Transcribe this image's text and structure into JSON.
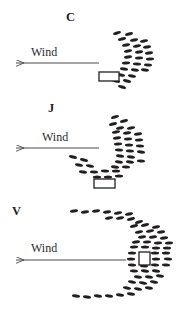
{
  "figure": {
    "title": "",
    "background_color": "#ffffff",
    "ink_color": "#231f20",
    "arrow_color": "#4a4a4a",
    "width": 183,
    "height": 315
  },
  "chart_data": {
    "type": "scatter",
    "title": "",
    "xlabel": "",
    "ylabel": "",
    "grid": false,
    "legend": null,
    "panels": [
      {
        "label": "C",
        "label_position": {
          "x": 66,
          "y": 11
        },
        "wind": {
          "text": "Wind",
          "text_position": {
            "x": 31,
            "y": 46
          },
          "arrow": {
            "x1": 99,
            "y1": 63,
            "x2": 9,
            "y2": 63,
            "direction": "left"
          }
        },
        "vessel": {
          "x": 99,
          "y": 72,
          "width": 20,
          "height": 9,
          "shape": "rectangle"
        },
        "marks": [
          {
            "x": 117,
            "y": 33,
            "angle": -18
          },
          {
            "x": 129,
            "y": 34,
            "angle": -14
          },
          {
            "x": 122,
            "y": 39,
            "angle": -14
          },
          {
            "x": 134,
            "y": 40,
            "angle": -12
          },
          {
            "x": 144,
            "y": 41,
            "angle": -10
          },
          {
            "x": 126,
            "y": 45,
            "angle": -12
          },
          {
            "x": 137,
            "y": 46,
            "angle": -10
          },
          {
            "x": 147,
            "y": 47,
            "angle": -8
          },
          {
            "x": 128,
            "y": 51,
            "angle": -10
          },
          {
            "x": 139,
            "y": 52,
            "angle": -8
          },
          {
            "x": 149,
            "y": 53,
            "angle": -6
          },
          {
            "x": 128,
            "y": 57,
            "angle": -6
          },
          {
            "x": 139,
            "y": 58,
            "angle": -4
          },
          {
            "x": 150,
            "y": 59,
            "angle": -2
          },
          {
            "x": 126,
            "y": 63,
            "angle": -2
          },
          {
            "x": 137,
            "y": 64,
            "angle": 2
          },
          {
            "x": 148,
            "y": 65,
            "angle": 4
          },
          {
            "x": 124,
            "y": 69,
            "angle": 6
          },
          {
            "x": 135,
            "y": 70,
            "angle": 8
          },
          {
            "x": 145,
            "y": 70,
            "angle": 8
          },
          {
            "x": 121,
            "y": 75,
            "angle": 10
          },
          {
            "x": 132,
            "y": 76,
            "angle": 12
          },
          {
            "x": 116,
            "y": 81,
            "angle": 14
          },
          {
            "x": 127,
            "y": 81,
            "angle": 14
          },
          {
            "x": 122,
            "y": 87,
            "angle": 16
          }
        ]
      },
      {
        "label": "J",
        "label_position": {
          "x": 48,
          "y": 102
        },
        "wind": {
          "text": "Wind",
          "text_position": {
            "x": 42,
            "y": 131
          },
          "arrow": {
            "x1": 99,
            "y1": 148,
            "x2": 9,
            "y2": 148,
            "direction": "left"
          }
        },
        "vessel": {
          "x": 94,
          "y": 179,
          "width": 21,
          "height": 9,
          "shape": "rectangle"
        },
        "marks": [
          {
            "x": 115,
            "y": 117,
            "angle": -16
          },
          {
            "x": 124,
            "y": 121,
            "angle": -14
          },
          {
            "x": 113,
            "y": 124,
            "angle": -14
          },
          {
            "x": 120,
            "y": 128,
            "angle": -12
          },
          {
            "x": 131,
            "y": 128,
            "angle": -10
          },
          {
            "x": 116,
            "y": 132,
            "angle": -10
          },
          {
            "x": 127,
            "y": 133,
            "angle": -8
          },
          {
            "x": 138,
            "y": 134,
            "angle": -6
          },
          {
            "x": 117,
            "y": 138,
            "angle": -6
          },
          {
            "x": 128,
            "y": 139,
            "angle": -4
          },
          {
            "x": 139,
            "y": 140,
            "angle": -2
          },
          {
            "x": 118,
            "y": 144,
            "angle": -2
          },
          {
            "x": 129,
            "y": 145,
            "angle": 0
          },
          {
            "x": 140,
            "y": 146,
            "angle": 2
          },
          {
            "x": 119,
            "y": 150,
            "angle": 2
          },
          {
            "x": 130,
            "y": 151,
            "angle": 4
          },
          {
            "x": 141,
            "y": 152,
            "angle": 6
          },
          {
            "x": 120,
            "y": 156,
            "angle": 6
          },
          {
            "x": 131,
            "y": 157,
            "angle": 8
          },
          {
            "x": 73,
            "y": 157,
            "angle": 14
          },
          {
            "x": 84,
            "y": 160,
            "angle": 14
          },
          {
            "x": 119,
            "y": 162,
            "angle": 8
          },
          {
            "x": 130,
            "y": 162,
            "angle": 8
          },
          {
            "x": 141,
            "y": 161,
            "angle": 4
          },
          {
            "x": 79,
            "y": 165,
            "angle": 12
          },
          {
            "x": 90,
            "y": 166,
            "angle": 10
          },
          {
            "x": 115,
            "y": 167,
            "angle": 6
          },
          {
            "x": 126,
            "y": 167,
            "angle": 4
          },
          {
            "x": 83,
            "y": 172,
            "angle": 6
          },
          {
            "x": 94,
            "y": 172,
            "angle": 4
          },
          {
            "x": 105,
            "y": 171,
            "angle": 2
          },
          {
            "x": 116,
            "y": 171,
            "angle": 0
          },
          {
            "x": 97,
            "y": 177,
            "angle": 0
          },
          {
            "x": 108,
            "y": 177,
            "angle": 0
          },
          {
            "x": 119,
            "y": 176,
            "angle": 0
          }
        ]
      },
      {
        "label": "V",
        "label_position": {
          "x": 12,
          "y": 205
        },
        "wind": {
          "text": "Wind",
          "text_position": {
            "x": 31,
            "y": 242
          },
          "arrow": {
            "x1": 126,
            "y1": 260,
            "x2": 9,
            "y2": 260,
            "direction": "left"
          }
        },
        "vessel": {
          "x": 139,
          "y": 252,
          "width": 11,
          "height": 13,
          "shape": "rectangle"
        },
        "marks": [
          {
            "x": 74,
            "y": 211,
            "angle": -6
          },
          {
            "x": 85,
            "y": 212,
            "angle": -6
          },
          {
            "x": 96,
            "y": 211,
            "angle": -8
          },
          {
            "x": 107,
            "y": 212,
            "angle": -8
          },
          {
            "x": 118,
            "y": 213,
            "angle": -10
          },
          {
            "x": 129,
            "y": 214,
            "angle": -12
          },
          {
            "x": 109,
            "y": 218,
            "angle": -10
          },
          {
            "x": 120,
            "y": 218,
            "angle": -12
          },
          {
            "x": 131,
            "y": 219,
            "angle": -14
          },
          {
            "x": 139,
            "y": 222,
            "angle": -16
          },
          {
            "x": 134,
            "y": 226,
            "angle": -14
          },
          {
            "x": 145,
            "y": 225,
            "angle": -14
          },
          {
            "x": 156,
            "y": 227,
            "angle": -12
          },
          {
            "x": 139,
            "y": 232,
            "angle": -10
          },
          {
            "x": 150,
            "y": 231,
            "angle": -10
          },
          {
            "x": 161,
            "y": 232,
            "angle": -8
          },
          {
            "x": 142,
            "y": 237,
            "angle": -8
          },
          {
            "x": 153,
            "y": 237,
            "angle": -6
          },
          {
            "x": 164,
            "y": 238,
            "angle": -6
          },
          {
            "x": 136,
            "y": 242,
            "angle": -6
          },
          {
            "x": 147,
            "y": 242,
            "angle": -4
          },
          {
            "x": 158,
            "y": 243,
            "angle": -4
          },
          {
            "x": 169,
            "y": 243,
            "angle": -2
          },
          {
            "x": 134,
            "y": 247,
            "angle": -2
          },
          {
            "x": 145,
            "y": 247,
            "angle": 0
          },
          {
            "x": 156,
            "y": 248,
            "angle": 0
          },
          {
            "x": 167,
            "y": 248,
            "angle": 0
          },
          {
            "x": 132,
            "y": 253,
            "angle": 0
          },
          {
            "x": 155,
            "y": 253,
            "angle": 0
          },
          {
            "x": 166,
            "y": 253,
            "angle": 0
          },
          {
            "x": 131,
            "y": 259,
            "angle": 0
          },
          {
            "x": 156,
            "y": 259,
            "angle": 0
          },
          {
            "x": 168,
            "y": 259,
            "angle": 2
          },
          {
            "x": 132,
            "y": 265,
            "angle": 2
          },
          {
            "x": 144,
            "y": 266,
            "angle": 2
          },
          {
            "x": 155,
            "y": 265,
            "angle": 4
          },
          {
            "x": 166,
            "y": 265,
            "angle": 4
          },
          {
            "x": 134,
            "y": 271,
            "angle": 4
          },
          {
            "x": 145,
            "y": 271,
            "angle": 6
          },
          {
            "x": 156,
            "y": 271,
            "angle": 6
          },
          {
            "x": 138,
            "y": 277,
            "angle": 8
          },
          {
            "x": 149,
            "y": 277,
            "angle": 8
          },
          {
            "x": 160,
            "y": 276,
            "angle": 8
          },
          {
            "x": 132,
            "y": 282,
            "angle": 10
          },
          {
            "x": 143,
            "y": 283,
            "angle": 10
          },
          {
            "x": 154,
            "y": 282,
            "angle": 10
          },
          {
            "x": 127,
            "y": 288,
            "angle": 10
          },
          {
            "x": 138,
            "y": 289,
            "angle": 10
          },
          {
            "x": 149,
            "y": 288,
            "angle": 8
          },
          {
            "x": 76,
            "y": 296,
            "angle": 6
          },
          {
            "x": 87,
            "y": 297,
            "angle": 6
          },
          {
            "x": 98,
            "y": 296,
            "angle": 6
          },
          {
            "x": 109,
            "y": 296,
            "angle": 6
          },
          {
            "x": 120,
            "y": 295,
            "angle": 6
          },
          {
            "x": 131,
            "y": 294,
            "angle": 6
          }
        ]
      }
    ]
  }
}
